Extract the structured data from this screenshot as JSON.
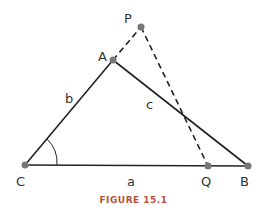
{
  "figure": {
    "caption": "FIGURE 15.1",
    "points": {
      "A": "A",
      "B": "B",
      "C": "C",
      "P": "P",
      "Q": "Q"
    },
    "sides": {
      "a": "a",
      "b": "b",
      "c": "c"
    },
    "colors": {
      "line": "#222222",
      "point": "#777777",
      "caption": "#b5523b"
    }
  }
}
